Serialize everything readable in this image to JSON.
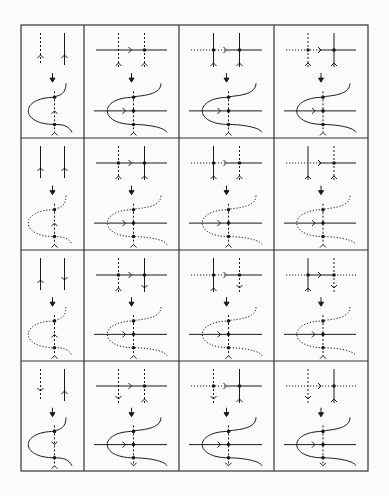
{
  "figure": {
    "grid": {
      "left": 21,
      "top": 25,
      "right": 368,
      "bottom": 471,
      "cols": [
        21,
        84,
        179,
        274,
        368
      ],
      "rows": [
        25,
        138,
        250,
        361,
        471
      ]
    },
    "colors": {
      "ink": "#1a1a1a",
      "frame": "#333333",
      "background": "#fbfbf9"
    },
    "cells": [
      {
        "row": 0,
        "col": 0,
        "top": {
          "type": "two-vertical",
          "left": "dashed-up",
          "right": "solid-up",
          "horizontal": "none"
        },
        "bottom": {
          "type": "fold",
          "loop": "solid",
          "mid_arrow": "up"
        }
      },
      {
        "row": 0,
        "col": 1,
        "top": {
          "type": "cross",
          "horizontal": "solid",
          "left": "dashed-up",
          "right": "dashed-up",
          "dots": 1
        },
        "bottom": {
          "type": "fold",
          "loop": "solid",
          "top_branch": "dotted"
        }
      },
      {
        "row": 0,
        "col": 2,
        "top": {
          "type": "cross",
          "horizontal": "dotted-solid",
          "left": "solid-up",
          "right": "solid-up",
          "dots": 2
        },
        "bottom": {
          "type": "fold",
          "loop": "solid"
        }
      },
      {
        "row": 0,
        "col": 3,
        "top": {
          "type": "cross",
          "horizontal": "dotted-solid",
          "left": "dashed-up",
          "right": "solid-up",
          "dots": 2
        },
        "bottom": {
          "type": "fold",
          "loop": "solid"
        }
      },
      {
        "row": 1,
        "col": 0,
        "top": {
          "type": "two-vertical",
          "left": "solid-up",
          "right": "solid-up",
          "horizontal": "none"
        },
        "bottom": {
          "type": "fold",
          "loop": "dotted",
          "mid_arrow": "up"
        }
      },
      {
        "row": 1,
        "col": 1,
        "top": {
          "type": "cross",
          "horizontal": "solid",
          "left": "dashed-up",
          "right": "solid-up",
          "dots": 2
        },
        "bottom": {
          "type": "fold",
          "loop": "dotted",
          "top_branch": "dotted"
        }
      },
      {
        "row": 1,
        "col": 2,
        "top": {
          "type": "cross",
          "horizontal": "dotted-solid",
          "left": "solid-up",
          "right": "dashed-up",
          "dots": 2
        },
        "bottom": {
          "type": "fold",
          "loop": "dotted",
          "top_branch": "dotted"
        }
      },
      {
        "row": 1,
        "col": 3,
        "top": {
          "type": "cross",
          "horizontal": "dotted-solid",
          "left": "solid-up",
          "right": "dashed-up",
          "dots": 1
        },
        "bottom": {
          "type": "fold",
          "loop": "dotted"
        }
      },
      {
        "row": 2,
        "col": 0,
        "top": {
          "type": "two-vertical",
          "left": "solid-up",
          "right": "solid-down",
          "horizontal": "none"
        },
        "bottom": {
          "type": "fold",
          "loop": "dotted",
          "mid_arrow": "up"
        }
      },
      {
        "row": 2,
        "col": 1,
        "top": {
          "type": "cross",
          "horizontal": "solid",
          "left": "dashed-up",
          "right": "solid-down",
          "dots": 2
        },
        "bottom": {
          "type": "fold",
          "loop": "dotted",
          "top_branch": "dotted"
        }
      },
      {
        "row": 2,
        "col": 2,
        "top": {
          "type": "cross",
          "horizontal": "dotted-solid",
          "left": "solid-up",
          "right": "dashed-down",
          "dots": 2
        },
        "bottom": {
          "type": "fold",
          "loop": "dotted",
          "top_branch": "dotted"
        }
      },
      {
        "row": 2,
        "col": 3,
        "top": {
          "type": "cross",
          "horizontal": "dotted-solid-dotted",
          "left": "solid-up",
          "right": "dashed-down",
          "dots": 2
        },
        "bottom": {
          "type": "fold",
          "loop": "dotted"
        }
      },
      {
        "row": 3,
        "col": 0,
        "top": {
          "type": "two-vertical",
          "left": "dashed-down",
          "right": "solid-up",
          "horizontal": "none"
        },
        "bottom": {
          "type": "fold",
          "loop": "solid",
          "mid_arrow": "down"
        }
      },
      {
        "row": 3,
        "col": 1,
        "top": {
          "type": "cross",
          "horizontal": "solid",
          "left": "dashed-down",
          "right": "dashed-up",
          "dots": 1
        },
        "bottom": {
          "type": "fold",
          "loop": "solid",
          "top_branch": "dotted",
          "bottom_arrow": "down"
        }
      },
      {
        "row": 3,
        "col": 2,
        "top": {
          "type": "cross",
          "horizontal": "dotted-solid",
          "left": "dashed-down",
          "right": "solid-up",
          "dots": 2
        },
        "bottom": {
          "type": "fold",
          "loop": "solid",
          "bottom_arrow": "down"
        }
      },
      {
        "row": 3,
        "col": 3,
        "top": {
          "type": "cross",
          "horizontal": "dotted",
          "left": "dashed-down",
          "right": "solid-up",
          "dots": 1
        },
        "bottom": {
          "type": "fold",
          "loop": "solid",
          "bottom_arrow": "down"
        }
      }
    ]
  }
}
